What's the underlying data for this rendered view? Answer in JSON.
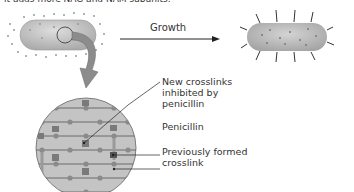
{
  "caption": {
    "top_text": "it adds more NAG and NAM subunits."
  },
  "diagram": {
    "growth_label": "Growth",
    "labels": {
      "new_crosslinks": [
        "New crosslinks",
        "inhibited by",
        "penicillin"
      ],
      "penicillin": "Penicillin",
      "previous_crosslink": [
        "Previously formed",
        "crosslink"
      ]
    },
    "colors": {
      "cell_fill": "#bdbdbd",
      "cell_highlight": "#d9d9d9",
      "dots": "#8a9a9a",
      "arrow": "#7f7f7f",
      "text": "#333333"
    }
  }
}
